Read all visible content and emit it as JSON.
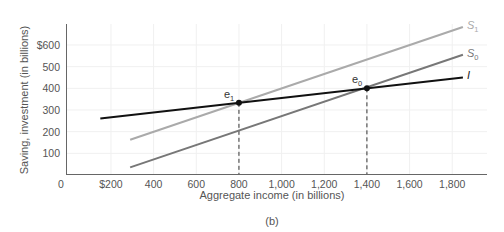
{
  "chart_data": {
    "type": "line",
    "title": "",
    "caption": "(b)",
    "xlabel": "Aggregate income (in billions)",
    "ylabel": "Saving, investment (in billions)",
    "xlim": [
      0,
      1900
    ],
    "ylim": [
      0,
      680
    ],
    "grid": true,
    "x_ticks": [
      {
        "value": 0,
        "label": "0"
      },
      {
        "value": 200,
        "label": "$200"
      },
      {
        "value": 400,
        "label": "400"
      },
      {
        "value": 600,
        "label": "600"
      },
      {
        "value": 800,
        "label": "800"
      },
      {
        "value": 1000,
        "label": "1,000"
      },
      {
        "value": 1200,
        "label": "1,200"
      },
      {
        "value": 1400,
        "label": "1,400"
      },
      {
        "value": 1600,
        "label": "1,600"
      },
      {
        "value": 1800,
        "label": "1,800"
      }
    ],
    "y_ticks": [
      {
        "value": 100,
        "label": "100"
      },
      {
        "value": 200,
        "label": "200"
      },
      {
        "value": 300,
        "label": "300"
      },
      {
        "value": 400,
        "label": "400"
      },
      {
        "value": 500,
        "label": "500"
      },
      {
        "value": 600,
        "label": "$600"
      }
    ],
    "series": [
      {
        "name": "S1",
        "label_main": "S",
        "label_sub": "1",
        "color": "#aaaaaa",
        "points": [
          [
            290,
            163
          ],
          [
            1850,
            683
          ]
        ]
      },
      {
        "name": "S0",
        "label_main": "S",
        "label_sub": "0",
        "color": "#777777",
        "points": [
          [
            290,
            35
          ],
          [
            1850,
            555
          ]
        ]
      },
      {
        "name": "I",
        "label_main": "I",
        "label_sub": "",
        "color": "#111111",
        "points": [
          [
            150,
            261
          ],
          [
            1850,
            450
          ]
        ]
      }
    ],
    "annotations": [
      {
        "name": "e1",
        "label_main": "e",
        "label_sub": "1",
        "x": 800,
        "y": 333
      },
      {
        "name": "e0",
        "label_main": "e",
        "label_sub": "0",
        "x": 1400,
        "y": 400
      }
    ]
  }
}
